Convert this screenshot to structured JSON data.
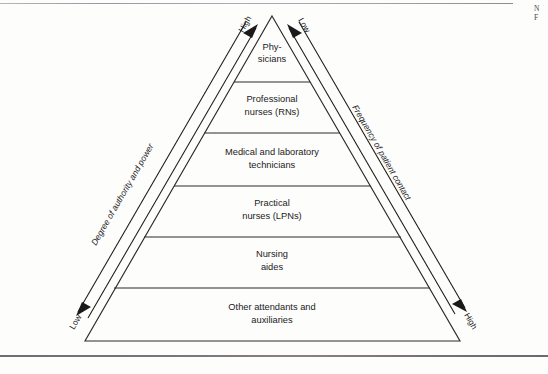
{
  "figure": {
    "type": "pyramid-hierarchy",
    "tiers": [
      {
        "id": "physicians",
        "lines": [
          "Phy-",
          "sicians"
        ]
      },
      {
        "id": "rns",
        "lines": [
          "Professional",
          "nurses (RNs)"
        ]
      },
      {
        "id": "technicians",
        "lines": [
          "Medical and laboratory",
          "technicians"
        ]
      },
      {
        "id": "lpns",
        "lines": [
          "Practical",
          "nurses (LPNs)"
        ]
      },
      {
        "id": "aides",
        "lines": [
          "Nursing",
          "aides"
        ]
      },
      {
        "id": "attendants",
        "lines": [
          "Other attendants and",
          "auxiliaries"
        ]
      }
    ],
    "left_axis": {
      "label": "Degree of authority and power",
      "top_value": "High",
      "bottom_value": "Low"
    },
    "right_axis": {
      "label": "Frequency of patient contact",
      "top_value": "Low",
      "bottom_value": "High"
    },
    "colors": {
      "ink": "#2b2b2b",
      "paper": "#fdfdfc",
      "rule": "#8c8c8c"
    }
  },
  "margin_note": {
    "line1": "N",
    "line2": "F"
  }
}
